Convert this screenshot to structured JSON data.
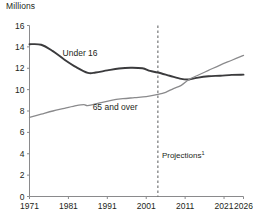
{
  "chart_data": {
    "type": "line",
    "title": "",
    "ylabel": "Millions",
    "xlabel": "",
    "ylim": [
      0,
      16
    ],
    "xlim": [
      1971,
      2026
    ],
    "yticks": [
      0,
      2,
      4,
      6,
      8,
      10,
      12,
      14,
      16
    ],
    "xticks": [
      1971,
      1981,
      1991,
      2001,
      2011,
      2021,
      2026
    ],
    "grid": false,
    "legend_position": "inline-labels",
    "annotations": [
      {
        "text": "Projections",
        "superscript": "1",
        "x": 2004,
        "y": 3.6,
        "kind": "divider-label"
      }
    ],
    "divider": {
      "x": 2004,
      "style": "dashed",
      "color": "#58595b"
    },
    "series": [
      {
        "name": "Under 16",
        "color": "#3b3b3d",
        "label_x": 1984,
        "label_y": 13.1,
        "x": [
          1971,
          1974,
          1977,
          1980,
          1983,
          1986,
          1988,
          1991,
          1994,
          1997,
          2000,
          2002,
          2004,
          2007,
          2010,
          2012,
          2014,
          2017,
          2020,
          2023,
          2026
        ],
        "values": [
          14.25,
          14.2,
          13.6,
          12.8,
          12.1,
          11.57,
          11.6,
          11.8,
          11.98,
          12.05,
          12.0,
          11.75,
          11.6,
          11.3,
          11.0,
          10.95,
          11.1,
          11.25,
          11.3,
          11.38,
          11.4
        ]
      },
      {
        "name": "65 and over",
        "color": "#8a8a8c",
        "label_x": 1993,
        "label_y": 8.1,
        "x": [
          1971,
          1974,
          1977,
          1980,
          1983,
          1985,
          1986,
          1989,
          1992,
          1995,
          1998,
          2001,
          2004,
          2006,
          2008,
          2010,
          2012,
          2014,
          2017,
          2020,
          2023,
          2026
        ],
        "values": [
          7.4,
          7.7,
          8.0,
          8.25,
          8.5,
          8.6,
          8.5,
          8.75,
          9.0,
          9.15,
          9.25,
          9.35,
          9.55,
          9.75,
          10.1,
          10.4,
          10.95,
          11.3,
          11.8,
          12.3,
          12.75,
          13.2
        ]
      }
    ]
  }
}
